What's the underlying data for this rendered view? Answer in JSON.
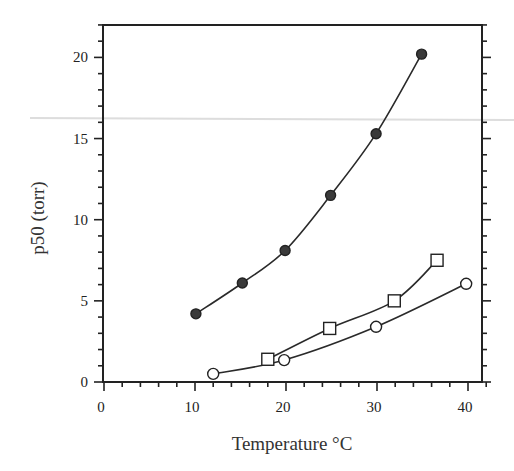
{
  "chart_data": {
    "type": "scatter",
    "title": "",
    "xlabel": "Temperature °C",
    "ylabel": "p50 (torr)",
    "xlim": [
      0,
      42
    ],
    "ylim": [
      0,
      22
    ],
    "xticks": [
      0,
      10,
      20,
      30,
      40
    ],
    "yticks": [
      0,
      5,
      10,
      15,
      20
    ],
    "x_minor_step": 2,
    "y_minor_step": 1,
    "grid": false,
    "legend": null,
    "series": [
      {
        "name": "filled circles",
        "marker": "filled-circle",
        "line": "smooth fit",
        "x": [
          10.1,
          15.2,
          19.9,
          24.9,
          29.9,
          34.9
        ],
        "y": [
          4.2,
          6.1,
          8.1,
          11.5,
          15.3,
          20.2
        ]
      },
      {
        "name": "open squares",
        "marker": "open-square",
        "line": "smooth fit",
        "x": [
          18.0,
          24.8,
          31.9,
          36.6
        ],
        "y": [
          1.4,
          3.3,
          5.0,
          7.5
        ]
      },
      {
        "name": "open circles",
        "marker": "open-circle",
        "line": "smooth fit",
        "x": [
          12.0,
          19.8,
          29.9,
          39.8
        ],
        "y": [
          0.5,
          1.35,
          3.4,
          6.05
        ]
      }
    ]
  },
  "labels": {
    "xlabel": "Temperature °C",
    "ylabel": "p50 (torr)"
  }
}
